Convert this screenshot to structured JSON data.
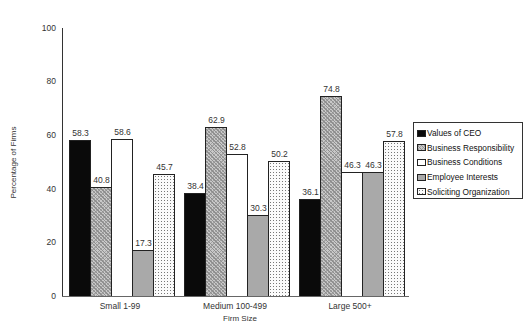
{
  "chart_data": {
    "type": "bar",
    "title": "",
    "xlabel": "Firm Size",
    "ylabel": "Percentage of Firms",
    "ylim": [
      0,
      100
    ],
    "yticks": [
      0,
      20,
      40,
      60,
      80,
      100
    ],
    "grid": false,
    "legend_position": "right",
    "categories": [
      "Small 1-99",
      "Medium 100-499",
      "Large 500+"
    ],
    "series": [
      {
        "name": "Values of CEO",
        "pattern": "solid-black",
        "color": "#0a0a0a",
        "values": [
          58.3,
          38.4,
          36.1
        ]
      },
      {
        "name": "Business Responsibility",
        "pattern": "crosshatch",
        "color": "#c9c9c9",
        "values": [
          40.8,
          62.9,
          74.8
        ]
      },
      {
        "name": "Business Conditions",
        "pattern": "white",
        "color": "#ffffff",
        "values": [
          58.6,
          52.8,
          46.3
        ]
      },
      {
        "name": "Employee Interests",
        "pattern": "solid-gray",
        "color": "#a9a9a9",
        "values": [
          17.3,
          30.3,
          46.3
        ]
      },
      {
        "name": "Soliciting Organization",
        "pattern": "dots",
        "color": "#fbfbfb",
        "values": [
          45.7,
          50.2,
          57.8
        ]
      }
    ]
  },
  "axes": {
    "ytick_labels": [
      "0",
      "20",
      "40",
      "60",
      "80",
      "100"
    ],
    "xlabel": "Firm Size",
    "ylabel": "Percentage of Firms"
  },
  "legend": {
    "items": [
      {
        "label": "Values of CEO"
      },
      {
        "label": "Business Responsibility"
      },
      {
        "label": "Business Conditions"
      },
      {
        "label": "Employee Interests"
      },
      {
        "label": "Soliciting Organization"
      }
    ]
  }
}
